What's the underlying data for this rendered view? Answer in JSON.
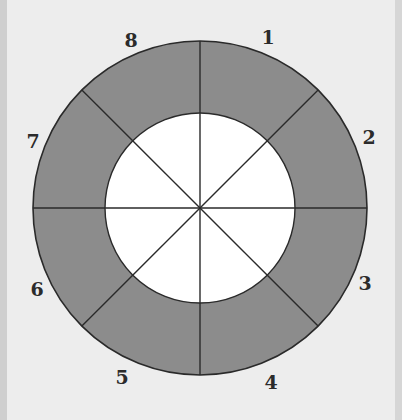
{
  "diagram": {
    "type": "annular-sector-ring",
    "center": {
      "x": 200,
      "y": 208
    },
    "outer_radius": 167,
    "inner_radius": 95,
    "sector_count": 8,
    "colors": {
      "background": "#ececec",
      "ring_fill": "#8c8c8c",
      "inner_fill": "#ffffff",
      "stroke": "#2a2a2a",
      "label": "#2b2b2b"
    },
    "sector_labels": [
      {
        "text": "1",
        "x": 268,
        "y": 44
      },
      {
        "text": "2",
        "x": 369,
        "y": 144
      },
      {
        "text": "3",
        "x": 365,
        "y": 290
      },
      {
        "text": "4",
        "x": 271,
        "y": 389
      },
      {
        "text": "5",
        "x": 122,
        "y": 384
      },
      {
        "text": "6",
        "x": 37,
        "y": 296
      },
      {
        "text": "7",
        "x": 33,
        "y": 148
      },
      {
        "text": "8",
        "x": 131,
        "y": 47
      }
    ]
  }
}
